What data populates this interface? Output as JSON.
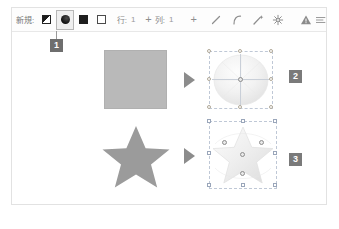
{
  "toolbar": {
    "new_label": "新規:",
    "shape_buttons": [
      {
        "name": "gradient-square-tool",
        "icon": "gradient-square-icon",
        "selected": false
      },
      {
        "name": "ellipse-tool",
        "icon": "filled-circle-icon",
        "selected": true
      },
      {
        "name": "filled-square-tool",
        "icon": "filled-square-icon",
        "selected": false
      },
      {
        "name": "outlined-square-tool",
        "icon": "outlined-square-icon",
        "selected": false
      }
    ],
    "row_label": "行:",
    "row_value": "1",
    "col_plus": "+",
    "col_label": "列:",
    "col_value": "1",
    "action_plus": "+",
    "icons": [
      {
        "name": "line-tool-icon"
      },
      {
        "name": "curve-tool-icon"
      },
      {
        "name": "wand-tool-icon"
      },
      {
        "name": "sparkle-tool-icon"
      },
      {
        "name": "warning-triangle-icon"
      },
      {
        "name": "menu-icon"
      }
    ]
  },
  "canvas": {
    "rows": [
      {
        "name": "square-row",
        "source_shape": "square",
        "arrow": "right-arrow",
        "result_shape": "ellipse-selected",
        "badge": "2"
      },
      {
        "name": "star-row",
        "source_shape": "star",
        "arrow": "right-arrow",
        "result_shape": "star-selected",
        "badge": "3"
      }
    ]
  },
  "callouts": {
    "tool_badge": "1",
    "result1_badge": "2",
    "result2_badge": "3"
  },
  "colors": {
    "shape_gray": "#b9b9b9",
    "arrow_gray": "#8c8c8c",
    "badge_gray": "#7a7a7a",
    "frame_border": "#e2e2e2",
    "selection_blue": "#bfc8d6"
  }
}
